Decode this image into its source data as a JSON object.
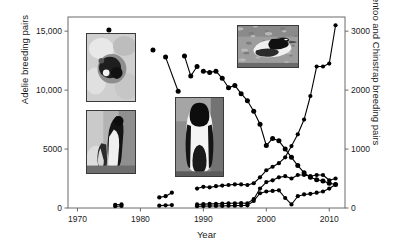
{
  "figure": {
    "caption_type": "scientific-figure",
    "background": "#ffffff",
    "marker_color": "#000000",
    "line_color": "#000000",
    "axis_color": "#555555"
  },
  "axes": {
    "x": {
      "label": "Year",
      "ticks": [
        "1970",
        "1980",
        "1990",
        "2000",
        "2010"
      ],
      "tick_values": [
        1970,
        1980,
        1990,
        2000,
        2010
      ],
      "range": [
        1968.5,
        2012.5
      ]
    },
    "y_left": {
      "label": "Adelie breeding pairs",
      "ticks": [
        "0",
        "5000",
        "10,000",
        "15,000"
      ],
      "tick_values": [
        0,
        5000,
        10000,
        15000
      ],
      "range": [
        0,
        16200
      ]
    },
    "y_right": {
      "label": "Gentoo and Chinstrap breeding pairs",
      "ticks": [
        "0",
        "1000",
        "2000",
        "3000"
      ],
      "tick_values": [
        0,
        1000,
        2000,
        3000
      ],
      "range": [
        0,
        3240
      ]
    }
  },
  "photos": [
    {
      "name": "adelie-nest-photo",
      "alt_label": "Adelie penguin on nest in snow",
      "x": 86,
      "y": 33,
      "w": 48,
      "h": 67,
      "scene": "nest-snow"
    },
    {
      "name": "chinstrap-pair-photo",
      "alt_label": "Chinstrap penguin with chick",
      "x": 86,
      "y": 110,
      "w": 48,
      "h": 62,
      "scene": "chinstrap"
    },
    {
      "name": "adelie-chick-photo",
      "alt_label": "Adelie penguin with chick",
      "x": 175,
      "y": 97,
      "w": 47,
      "h": 78,
      "scene": "adelie-chick"
    },
    {
      "name": "gentoo-photo",
      "alt_label": "Gentoo penguin on rocky ground",
      "x": 237,
      "y": 25,
      "w": 60,
      "h": 41,
      "scene": "gentoo"
    }
  ],
  "chart_data": {
    "type": "scatter",
    "title": "",
    "subtitle": "",
    "xlabel": "Year",
    "ylabel": "Adelie breeding pairs",
    "ylabel_secondary": "Gentoo and Chinstrap breeding pairs",
    "xlim": [
      1968.5,
      2012.5
    ],
    "ylim": [
      0,
      16200
    ],
    "ylim_secondary": [
      0,
      3240
    ],
    "grid": false,
    "legend": "none",
    "series": [
      {
        "name": "Adelie breeding pairs",
        "axis": "left",
        "marker": "filled-circle",
        "segments": [
          {
            "x": [
              1975
            ],
            "y": [
              15100
            ]
          },
          {
            "x": [
              1982
            ],
            "y": [
              13400
            ]
          },
          {
            "x": [
              1984,
              1986
            ],
            "y": [
              12800,
              9900
            ]
          },
          {
            "x": [
              1987,
              1988,
              1989
            ],
            "y": [
              12900,
              11200,
              12000
            ]
          },
          {
            "x": [
              1990,
              1991,
              1992,
              1993,
              1994,
              1995,
              1996,
              1997,
              1998,
              1999,
              2000,
              2001,
              2002,
              2003,
              2004,
              2005,
              2006,
              2007,
              2008,
              2009,
              2010,
              2011
            ],
            "y": [
              11600,
              11500,
              11600,
              11000,
              10200,
              10400,
              9700,
              9100,
              8200,
              7100,
              5300,
              5900,
              5700,
              5000,
              4300,
              3600,
              3000,
              2600,
              2400,
              2300,
              2100,
              2000
            ]
          }
        ]
      },
      {
        "name": "Gentoo breeding pairs",
        "axis": "right",
        "marker": "filled-circle",
        "segments": [
          {
            "x": [
              1976,
              1977
            ],
            "y": [
              55,
              60
            ]
          },
          {
            "x": [
              1983,
              1984,
              1985
            ],
            "y": [
              180,
              200,
              260
            ]
          },
          {
            "x": [
              1989,
              1990,
              1991,
              1992,
              1993,
              1994,
              1995,
              1996,
              1997,
              1998,
              1999,
              2000,
              2001,
              2002,
              2003,
              2004,
              2005,
              2006,
              2007,
              2008,
              2009,
              2010,
              2011
            ],
            "y": [
              330,
              360,
              350,
              370,
              380,
              390,
              400,
              400,
              390,
              420,
              520,
              640,
              700,
              760,
              860,
              1050,
              1250,
              1500,
              1900,
              2400,
              2400,
              2450,
              3100
            ]
          }
        ]
      },
      {
        "name": "Chinstrap breeding pairs",
        "axis": "right",
        "marker": "filled-circle",
        "segments": [
          {
            "x": [
              1976,
              1977
            ],
            "y": [
              30,
              35
            ]
          },
          {
            "x": [
              1983,
              1984,
              1985
            ],
            "y": [
              40,
              45,
              50
            ]
          },
          {
            "x": [
              1989,
              1990,
              1991,
              1992,
              1993,
              1994,
              1995,
              1996,
              1997,
              1998,
              1999,
              2000,
              2001,
              2002,
              2003,
              2004,
              2005,
              2006,
              2007,
              2008,
              2009,
              2010,
              2011
            ],
            "y": [
              60,
              65,
              70,
              70,
              75,
              80,
              80,
              85,
              80,
              150,
              330,
              440,
              470,
              520,
              540,
              500,
              560,
              560,
              540,
              560,
              560,
              470,
              500
            ]
          }
        ]
      },
      {
        "name": "Chinstrap lower series",
        "axis": "right",
        "marker": "filled-circle",
        "segments": [
          {
            "x": [
              1989,
              1990,
              1991,
              1992,
              1993,
              1994,
              1995,
              1996,
              1997,
              1998,
              1999,
              2000,
              2001,
              2002,
              2003,
              2004,
              2005,
              2006,
              2007,
              2008,
              2009,
              2010,
              2011
            ],
            "y": [
              30,
              32,
              34,
              35,
              36,
              38,
              40,
              42,
              45,
              120,
              250,
              280,
              290,
              300,
              170,
              60,
              200,
              230,
              240,
              260,
              280,
              330,
              400
            ]
          }
        ]
      }
    ]
  }
}
